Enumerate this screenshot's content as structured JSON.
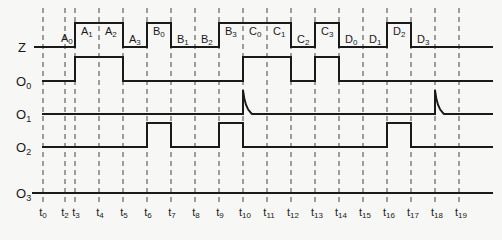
{
  "diagram": {
    "type": "timing-diagram",
    "signals": [
      {
        "name": "Z",
        "base": "Z",
        "sub": ""
      },
      {
        "name": "O0",
        "base": "O",
        "sub": "0"
      },
      {
        "name": "O1",
        "base": "O",
        "sub": "1"
      },
      {
        "name": "O2",
        "base": "O",
        "sub": "2"
      },
      {
        "name": "O3",
        "base": "O",
        "sub": "3"
      }
    ],
    "z_states": [
      {
        "base": "A",
        "sub": "0"
      },
      {
        "base": "A",
        "sub": "1"
      },
      {
        "base": "A",
        "sub": "2"
      },
      {
        "base": "A",
        "sub": "3"
      },
      {
        "base": "B",
        "sub": "0"
      },
      {
        "base": "B",
        "sub": "1"
      },
      {
        "base": "B",
        "sub": "2"
      },
      {
        "base": "B",
        "sub": "3"
      },
      {
        "base": "C",
        "sub": "0"
      },
      {
        "base": "C",
        "sub": "1"
      },
      {
        "base": "C",
        "sub": "2"
      },
      {
        "base": "C",
        "sub": "3"
      },
      {
        "base": "D",
        "sub": "0"
      },
      {
        "base": "D",
        "sub": "1"
      },
      {
        "base": "D",
        "sub": "2"
      },
      {
        "base": "D",
        "sub": "3"
      }
    ],
    "time_ticks": [
      {
        "base": "t",
        "sub": "0"
      },
      {
        "base": "t",
        "sub": "2"
      },
      {
        "base": "t",
        "sub": "3"
      },
      {
        "base": "t",
        "sub": "4"
      },
      {
        "base": "t",
        "sub": "5"
      },
      {
        "base": "t",
        "sub": "6"
      },
      {
        "base": "t",
        "sub": "7"
      },
      {
        "base": "t",
        "sub": "8"
      },
      {
        "base": "t",
        "sub": "9"
      },
      {
        "base": "t",
        "sub": "10"
      },
      {
        "base": "t",
        "sub": "11"
      },
      {
        "base": "t",
        "sub": "12"
      },
      {
        "base": "t",
        "sub": "13"
      },
      {
        "base": "t",
        "sub": "14"
      },
      {
        "base": "t",
        "sub": "15"
      },
      {
        "base": "t",
        "sub": "16"
      },
      {
        "base": "t",
        "sub": "17"
      },
      {
        "base": "t",
        "sub": "18"
      },
      {
        "base": "t",
        "sub": "19"
      }
    ]
  }
}
